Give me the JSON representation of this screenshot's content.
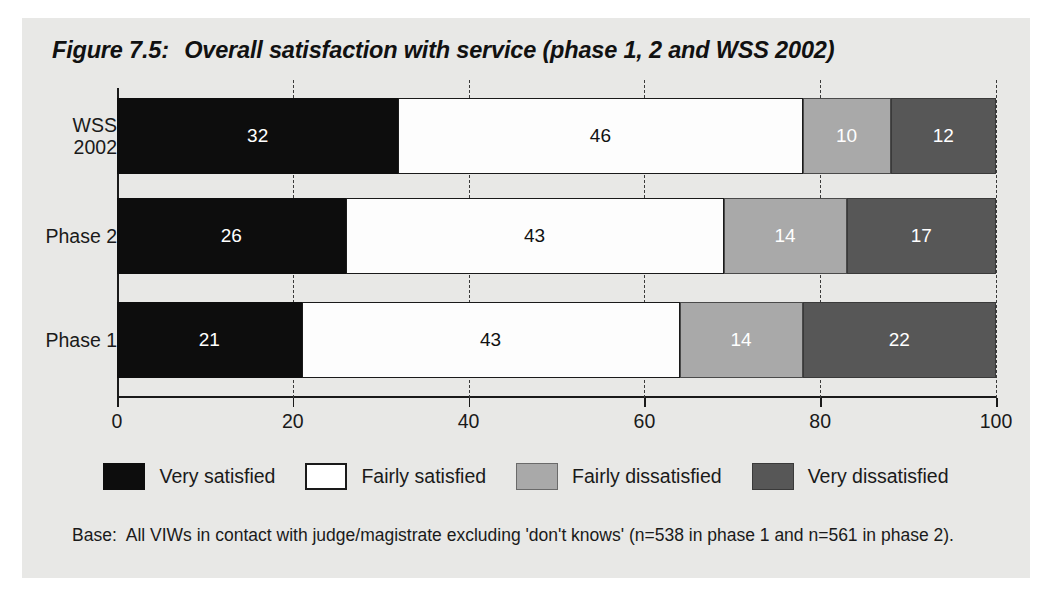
{
  "figure": {
    "title_label": "Figure 7.5:",
    "title_text": "Overall satisfaction with service (phase 1, 2 and WSS 2002)",
    "base_prefix": "Base:",
    "base_text": "All VIWs in contact with judge/magistrate excluding 'don't knows' (n=538 in phase 1 and n=561 in phase 2)."
  },
  "chart_data": {
    "type": "bar",
    "orientation": "horizontal",
    "stacked": true,
    "stack_mode": "percent",
    "xlabel": "",
    "ylabel": "",
    "xlim": [
      0,
      100
    ],
    "xticks": [
      0,
      20,
      40,
      60,
      80,
      100
    ],
    "xticklabels": [
      "0",
      "20",
      "40",
      "60",
      "80",
      "100"
    ],
    "grid": "vertical-dashed",
    "legend_position": "bottom-center",
    "categories": [
      "WSS 2002",
      "Phase 2",
      "Phase 1"
    ],
    "category_lines": [
      [
        "WSS",
        "2002"
      ],
      [
        "Phase 2"
      ],
      [
        "Phase 1"
      ]
    ],
    "series": [
      {
        "name": "Very satisfied",
        "color": "#0d0d0d",
        "values": [
          32,
          26,
          21
        ]
      },
      {
        "name": "Fairly satisfied",
        "color": "#ffffff",
        "values": [
          46,
          43,
          43
        ]
      },
      {
        "name": "Fairly dissatisfied",
        "color": "#a9a9a9",
        "values": [
          10,
          14,
          14
        ]
      },
      {
        "name": "Very dissatisfied",
        "color": "#575757",
        "values": [
          12,
          17,
          22
        ]
      }
    ],
    "rows": [
      {
        "category": "WSS 2002",
        "values": [
          32,
          46,
          10,
          12
        ]
      },
      {
        "category": "Phase 2",
        "values": [
          26,
          43,
          14,
          17
        ]
      },
      {
        "category": "Phase 1",
        "values": [
          21,
          43,
          14,
          22
        ]
      }
    ]
  },
  "legend": {
    "items": [
      {
        "label": "Very satisfied",
        "swatch": "swatch-black"
      },
      {
        "label": "Fairly satisfied",
        "swatch": "swatch-white"
      },
      {
        "label": "Fairly dissatisfied",
        "swatch": "swatch-light-gray"
      },
      {
        "label": "Very dissatisfied",
        "swatch": "swatch-dark-gray"
      }
    ]
  },
  "colors": {
    "panel_background": "#e8e8e6",
    "ink": "#1a1a1a",
    "very_satisfied": "#0d0d0d",
    "fairly_satisfied": "#ffffff",
    "fairly_dissatisfied": "#a9a9a9",
    "very_dissatisfied": "#575757"
  }
}
